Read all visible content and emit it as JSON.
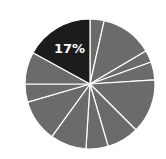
{
  "chart_data": {
    "type": "pie",
    "title": "",
    "start_angle_deg": 0,
    "direction": "clockwise",
    "center": [
      90,
      84
    ],
    "radius": 65,
    "slice_border_color": "#ffffff",
    "categories": [
      "s1",
      "s2",
      "s3",
      "s4",
      "s5",
      "s6",
      "s7",
      "s8",
      "s9",
      "s10",
      "s11",
      "s12"
    ],
    "values": [
      3.5,
      13,
      3,
      4.5,
      13.5,
      8,
      5.5,
      9,
      10.5,
      4.5,
      8,
      17
    ],
    "colors": [
      "#6b6b6b",
      "#6b6b6b",
      "#6b6b6b",
      "#6b6b6b",
      "#6b6b6b",
      "#6b6b6b",
      "#6b6b6b",
      "#6b6b6b",
      "#6b6b6b",
      "#6b6b6b",
      "#6b6b6b",
      "#1c1c1c"
    ],
    "labels": [
      "",
      "",
      "",
      "",
      "",
      "",
      "",
      "",
      "",
      "",
      "",
      "17%"
    ],
    "highlight_index": 11,
    "legend": null
  }
}
